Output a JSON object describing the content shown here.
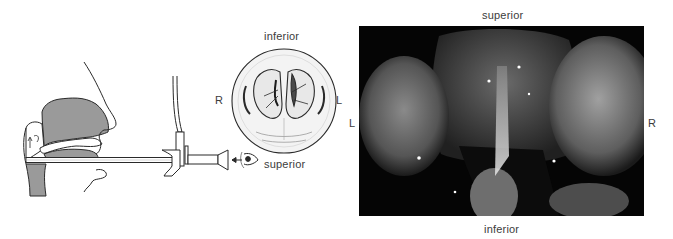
{
  "figure": {
    "diagram": {
      "title": "Indirect laryngoscopy schematic",
      "mirror_view_labels": {
        "top": "inferior",
        "left": "R",
        "right": "L"
      },
      "eye_label": "superior",
      "icons": [
        "head-profile-icon",
        "laryngoscope-icon",
        "eye-icon",
        "larynx-view-circle-icon"
      ]
    },
    "photo": {
      "description": "Endoscopic view of larynx",
      "labels": {
        "top": "superior",
        "bottom": "inferior",
        "left": "L",
        "right": "R"
      }
    },
    "colors": {
      "background": "#ffffff",
      "line": "#2a2a2a",
      "tissue_fill": "#9a9a9a",
      "photo_bg": "#050505",
      "label_text": "#3c3c3c"
    }
  }
}
